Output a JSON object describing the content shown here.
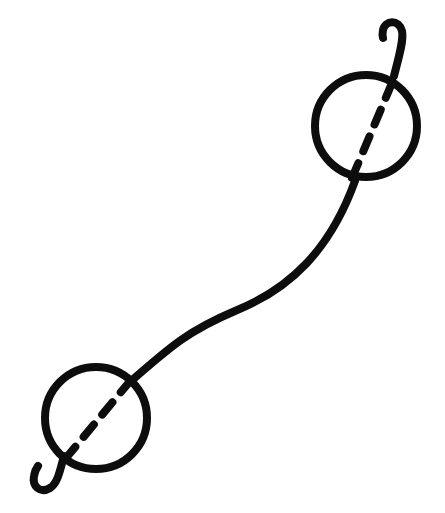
{
  "canvas": {
    "width": 445,
    "height": 513,
    "background_color": "#ffffff",
    "title": "Line drawing of two hooked rings joined by an S-curve"
  },
  "style": {
    "ink_color": "#0d0d0d",
    "stroke_width": 8,
    "dash_stroke_width": 8,
    "dash_pattern": "16 13",
    "line_cap": "round",
    "line_join": "round"
  },
  "figure": {
    "type": "line-art",
    "parts": {
      "top_ring": {
        "name": "upper-ring",
        "center_x": 366,
        "center_y": 126,
        "radius": 51
      },
      "top_ring_dash": {
        "name": "upper-ring-dashed-axis",
        "x1": 392,
        "y1": 83,
        "x2": 352,
        "y2": 178
      },
      "top_hook": {
        "name": "upper-hook",
        "path": "M 394,76 C 399,56 404,40 402,31 C 399,19 385,20 383,30 C 382,35 383,38 383,38"
      },
      "bottom_ring": {
        "name": "lower-ring",
        "center_x": 96,
        "center_y": 418,
        "radius": 51
      },
      "bottom_ring_dash": {
        "name": "lower-ring-dashed-axis",
        "x1": 131,
        "y1": 380,
        "x2": 66,
        "y2": 458
      },
      "bottom_hook": {
        "name": "lower-hook",
        "path": "M 64,456 C 60,470 58,483 50,488 C 40,494 32,486 34,476 C 35,470 38,466 38,466"
      },
      "connector_curve": {
        "name": "s-curve-connector",
        "path": "M 130,382 C 172,345 190,330 235,311 C 290,289 330,250 355,181",
        "start_x": 130,
        "start_y": 382,
        "end_x": 355,
        "end_y": 181
      }
    }
  }
}
